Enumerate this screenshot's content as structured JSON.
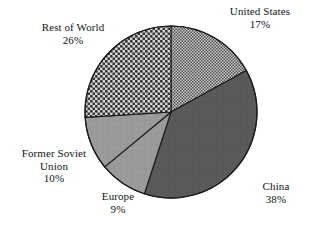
{
  "chart_data": {
    "type": "pie",
    "title": "",
    "subtitle": "",
    "xlabel": "",
    "ylabel": "",
    "legend_position": "none",
    "grid": false,
    "units": "percent",
    "start_angle_deg": 0,
    "direction": "clockwise",
    "categories": [
      "United States",
      "China",
      "Europe",
      "Former Soviet Union",
      "Rest of World"
    ],
    "values": [
      17,
      38,
      9,
      10,
      26
    ],
    "slices": [
      {
        "name": "United States",
        "value": 17,
        "value_label": "17%",
        "label_lines": [
          "United States",
          "17%"
        ],
        "fill_style": "fine-checker",
        "fill_color": "#8c8c8c",
        "start_deg": 0,
        "end_deg": 61.2
      },
      {
        "name": "China",
        "value": 38,
        "value_label": "38%",
        "label_lines": [
          "China",
          "38%"
        ],
        "fill_style": "solid-dark",
        "fill_color": "#595959",
        "start_deg": 61.2,
        "end_deg": 198.0
      },
      {
        "name": "Europe",
        "value": 9,
        "value_label": "9%",
        "label_lines": [
          "Europe",
          "9%"
        ],
        "fill_style": "solid-medium",
        "fill_color": "#9a9a9a",
        "start_deg": 198.0,
        "end_deg": 230.4
      },
      {
        "name": "Former Soviet Union",
        "value": 10,
        "value_label": "10%",
        "label_lines": [
          "Former Soviet",
          "Union",
          "10%"
        ],
        "fill_style": "solid-medium",
        "fill_color": "#9a9a9a",
        "start_deg": 230.4,
        "end_deg": 266.4
      },
      {
        "name": "Rest of World",
        "value": 26,
        "value_label": "26%",
        "label_lines": [
          "Rest of World",
          "26%"
        ],
        "fill_style": "dense-diamond",
        "fill_color": "#6e6e6e",
        "start_deg": 266.4,
        "end_deg": 360.0
      }
    ]
  },
  "labels": {
    "united_states": {
      "name": "United States",
      "value": "17%"
    },
    "china": {
      "name": "China",
      "value": "38%"
    },
    "europe": {
      "name": "Europe",
      "value": "9%"
    },
    "former_soviet_union": {
      "name_line1": "Former Soviet",
      "name_line2": "Union",
      "value": "10%"
    },
    "rest_of_world": {
      "name": "Rest of World",
      "value": "26%"
    }
  },
  "colors": {
    "background": "#ffffff",
    "outline": "#1a1a1a",
    "text": "#141414",
    "united_states": "#8c8c8c",
    "china": "#595959",
    "europe": "#9a9a9a",
    "former_soviet_union": "#9a9a9a",
    "rest_of_world": "#6e6e6e"
  },
  "geometry": {
    "center_x": 171,
    "center_y": 112,
    "radius": 86
  }
}
